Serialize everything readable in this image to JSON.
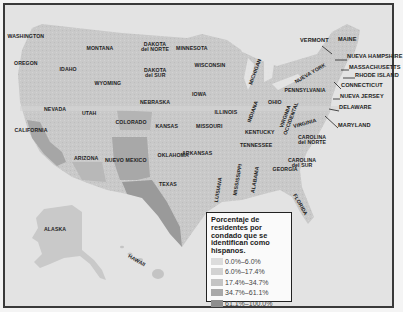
{
  "map": {
    "type": "choropleth",
    "subject": "Hispanic residents by county, United States",
    "colors": {
      "water": "#e3e3e3",
      "land_base": "#c8c8c8",
      "frame": "#3a3a3a"
    },
    "states": [
      {
        "name": "WASHINGTON",
        "x": 26,
        "y": 37
      },
      {
        "name": "OREGON",
        "x": 26,
        "y": 64
      },
      {
        "name": "IDAHO",
        "x": 68,
        "y": 70
      },
      {
        "name": "MONTANA",
        "x": 100,
        "y": 49
      },
      {
        "name": "WYOMING",
        "x": 108,
        "y": 84
      },
      {
        "name": "DAKOTA\ndel NORTE",
        "x": 155,
        "y": 47
      },
      {
        "name": "DAKOTA\ndel SUR",
        "x": 155,
        "y": 73
      },
      {
        "name": "MINNESOTA",
        "x": 192,
        "y": 49
      },
      {
        "name": "WISCONSIN",
        "x": 210,
        "y": 66
      },
      {
        "name": "MICHIGAN",
        "x": 255,
        "y": 72,
        "rotate": -70
      },
      {
        "name": "NEBRASKA",
        "x": 155,
        "y": 103
      },
      {
        "name": "IOWA",
        "x": 199,
        "y": 95
      },
      {
        "name": "ILLINOIS",
        "x": 226,
        "y": 113
      },
      {
        "name": "INDIANA",
        "x": 253,
        "y": 112,
        "rotate": -70
      },
      {
        "name": "OHIO",
        "x": 275,
        "y": 103
      },
      {
        "name": "PENNSYLVANIA",
        "x": 305,
        "y": 91
      },
      {
        "name": "NUEVA YORK",
        "x": 310,
        "y": 74,
        "rotate": -30
      },
      {
        "name": "VIRGINIA\nOCCIDENTAL",
        "x": 288,
        "y": 117,
        "rotate": -70
      },
      {
        "name": "VIRGINIA",
        "x": 305,
        "y": 124,
        "rotate": -15
      },
      {
        "name": "KENTUCKY",
        "x": 260,
        "y": 133
      },
      {
        "name": "TENNESSEE",
        "x": 256,
        "y": 146
      },
      {
        "name": "CAROLINA\ndel NORTE",
        "x": 312,
        "y": 140
      },
      {
        "name": "CAROLINA\ndel SUR",
        "x": 302,
        "y": 163
      },
      {
        "name": "GEORGIA",
        "x": 285,
        "y": 170
      },
      {
        "name": "ALABAMA",
        "x": 255,
        "y": 180,
        "rotate": -80
      },
      {
        "name": "MISSISSIPPI",
        "x": 238,
        "y": 180,
        "rotate": -80
      },
      {
        "name": "LUISIANA",
        "x": 218,
        "y": 190,
        "rotate": -80
      },
      {
        "name": "FLORIDA",
        "x": 300,
        "y": 205,
        "rotate": 60
      },
      {
        "name": "ARKANSAS",
        "x": 197,
        "y": 154
      },
      {
        "name": "MISSOURI",
        "x": 209,
        "y": 127
      },
      {
        "name": "KANSAS",
        "x": 167,
        "y": 127
      },
      {
        "name": "OKLAHOMA",
        "x": 173,
        "y": 156
      },
      {
        "name": "TEXAS",
        "x": 168,
        "y": 185
      },
      {
        "name": "NUEVO MEXICO",
        "x": 126,
        "y": 161
      },
      {
        "name": "COLORADO",
        "x": 131,
        "y": 123
      },
      {
        "name": "ARIZONA",
        "x": 86,
        "y": 159
      },
      {
        "name": "UTAH",
        "x": 89,
        "y": 114
      },
      {
        "name": "NEVADA",
        "x": 55,
        "y": 110
      },
      {
        "name": "CALIFORNIA",
        "x": 31,
        "y": 131
      },
      {
        "name": "ALASKA",
        "x": 55,
        "y": 230
      },
      {
        "name": "HAWAII",
        "x": 136,
        "y": 261,
        "rotate": 30
      }
    ],
    "northeast_callouts": [
      {
        "name": "VERMONT",
        "x": 300,
        "y": 41
      },
      {
        "name": "MAINE",
        "x": 338,
        "y": 40
      },
      {
        "name": "NUEVA HAMPSHIRE",
        "x": 347,
        "y": 57
      },
      {
        "name": "MASSACHUSETTS",
        "x": 349,
        "y": 68
      },
      {
        "name": "RHODE ISLAND",
        "x": 355,
        "y": 76
      },
      {
        "name": "CONNECTICUT",
        "x": 341,
        "y": 86
      },
      {
        "name": "NUEVA JERSEY",
        "x": 340,
        "y": 97
      },
      {
        "name": "DELAWARE",
        "x": 339,
        "y": 108
      },
      {
        "name": "MARYLAND",
        "x": 338,
        "y": 126
      }
    ]
  },
  "legend": {
    "title": "Porcentaje de residentes por condado que se identifican como hispanos.",
    "items": [
      {
        "label": "0.0%–6.0%",
        "color": "#dcdcdc"
      },
      {
        "label": "6.0%–17.4%",
        "color": "#d2d2d2"
      },
      {
        "label": "17.4%–34.7%",
        "color": "#c4c4c4"
      },
      {
        "label": "34.7%–61.1%",
        "color": "#a9a9a9"
      },
      {
        "label": "61.1%–100.0%",
        "color": "#8e8e8e"
      }
    ]
  }
}
